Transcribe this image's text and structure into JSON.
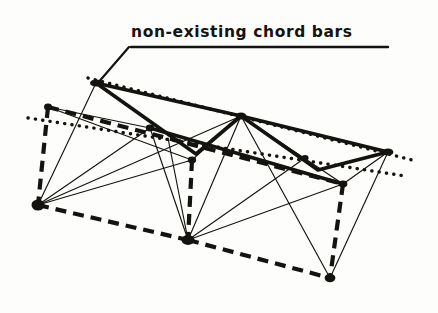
{
  "figure": {
    "kind": "structural-truss-line-diagram",
    "background_color": "#fdfdfb",
    "ink_color": "#15130f",
    "annotation": {
      "text": "non-existing  chord bars",
      "underline": {
        "x1": 131,
        "y1": 47,
        "x2": 388,
        "y2": 47
      },
      "leader": {
        "x1": 129,
        "y1": 47,
        "x2": 97,
        "y2": 84
      }
    },
    "nodes": [
      {
        "name": "top-left-apex",
        "x": 96,
        "y": 83
      },
      {
        "name": "upper-left-corner",
        "x": 48,
        "y": 107
      },
      {
        "name": "bottom-left",
        "x": 38,
        "y": 205
      },
      {
        "name": "mid-upper-left",
        "x": 150,
        "y": 128
      },
      {
        "name": "mid-node",
        "x": 192,
        "y": 160
      },
      {
        "name": "top-apex-center",
        "x": 241,
        "y": 116
      },
      {
        "name": "bottom-center",
        "x": 188,
        "y": 240
      },
      {
        "name": "mid-right-node",
        "x": 305,
        "y": 158
      },
      {
        "name": "right-lower-node",
        "x": 343,
        "y": 184
      },
      {
        "name": "right-end",
        "x": 388,
        "y": 152
      },
      {
        "name": "bottom-right",
        "x": 330,
        "y": 278
      }
    ],
    "dotted_chords": [
      {
        "name": "upper-dotted-chord",
        "x1": 88,
        "y1": 78,
        "x2": 412,
        "y2": 160
      },
      {
        "name": "lower-dotted-chord",
        "x1": 28,
        "y1": 118,
        "x2": 405,
        "y2": 176
      }
    ],
    "solid_chords": [
      {
        "name": "top-chord-left-descend",
        "x1": 96,
        "y1": 83,
        "x2": 196,
        "y2": 154
      },
      {
        "name": "top-chord-rise-to-apex",
        "x1": 196,
        "y1": 154,
        "x2": 241,
        "y2": 116
      },
      {
        "name": "top-chord-apex-descend",
        "x1": 241,
        "y1": 116,
        "x2": 318,
        "y2": 170
      },
      {
        "name": "top-chord-rise-to-right-end",
        "x1": 318,
        "y1": 170,
        "x2": 388,
        "y2": 152
      },
      {
        "name": "upper-rail-left",
        "x1": 96,
        "y1": 83,
        "x2": 241,
        "y2": 116
      },
      {
        "name": "upper-rail-right",
        "x1": 241,
        "y1": 116,
        "x2": 388,
        "y2": 152
      },
      {
        "name": "mid-rail",
        "x1": 150,
        "y1": 128,
        "x2": 343,
        "y2": 184
      }
    ],
    "dashed_chords": [
      {
        "name": "left-vertical-dashed",
        "x1": 48,
        "y1": 107,
        "x2": 38,
        "y2": 205
      },
      {
        "name": "upper-dashed-rail",
        "x1": 48,
        "y1": 107,
        "x2": 343,
        "y2": 184
      },
      {
        "name": "lower-dashed-chord",
        "x1": 38,
        "y1": 205,
        "x2": 188,
        "y2": 240
      },
      {
        "name": "bottom-dashed-chord",
        "x1": 188,
        "y1": 240,
        "x2": 330,
        "y2": 278
      },
      {
        "name": "dashed-vertical-mid",
        "x1": 192,
        "y1": 160,
        "x2": 188,
        "y2": 240
      },
      {
        "name": "dashed-vertical-right",
        "x1": 343,
        "y1": 184,
        "x2": 330,
        "y2": 278
      }
    ],
    "web_members": [
      {
        "name": "web-bl-to-topleft",
        "x1": 38,
        "y1": 205,
        "x2": 96,
        "y2": 83
      },
      {
        "name": "web-bl-to-midupper",
        "x1": 38,
        "y1": 205,
        "x2": 150,
        "y2": 128
      },
      {
        "name": "web-bl-to-midnode",
        "x1": 38,
        "y1": 205,
        "x2": 192,
        "y2": 160
      },
      {
        "name": "web-bl-to-apex",
        "x1": 38,
        "y1": 205,
        "x2": 241,
        "y2": 116
      },
      {
        "name": "web-ul-to-midnode",
        "x1": 48,
        "y1": 107,
        "x2": 192,
        "y2": 160
      },
      {
        "name": "web-bc-to-midupper",
        "x1": 188,
        "y1": 240,
        "x2": 150,
        "y2": 128
      },
      {
        "name": "web-bc-to-topleftchord",
        "x1": 188,
        "y1": 240,
        "x2": 170,
        "y2": 140
      },
      {
        "name": "web-bc-to-apex",
        "x1": 188,
        "y1": 240,
        "x2": 241,
        "y2": 116
      },
      {
        "name": "web-bc-to-midright",
        "x1": 188,
        "y1": 240,
        "x2": 305,
        "y2": 158
      },
      {
        "name": "web-bc-to-rightlower",
        "x1": 188,
        "y1": 240,
        "x2": 343,
        "y2": 184
      },
      {
        "name": "web-br-to-apex",
        "x1": 330,
        "y1": 278,
        "x2": 241,
        "y2": 116
      },
      {
        "name": "web-br-to-rightend",
        "x1": 330,
        "y1": 278,
        "x2": 388,
        "y2": 152
      },
      {
        "name": "web-rl-to-rightend",
        "x1": 343,
        "y1": 184,
        "x2": 388,
        "y2": 152
      },
      {
        "name": "web-apex-to-rightlower",
        "x1": 241,
        "y1": 116,
        "x2": 343,
        "y2": 184
      }
    ]
  }
}
